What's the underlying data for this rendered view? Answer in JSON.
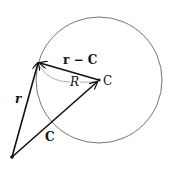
{
  "diagram": {
    "labels": {
      "r": "r",
      "r_minus_C": "r − C",
      "R": "R",
      "C_point": "C",
      "C_vector": "C"
    },
    "colors": {
      "stroke": "#111111",
      "circle": "#666666",
      "arc": "#888888"
    }
  }
}
